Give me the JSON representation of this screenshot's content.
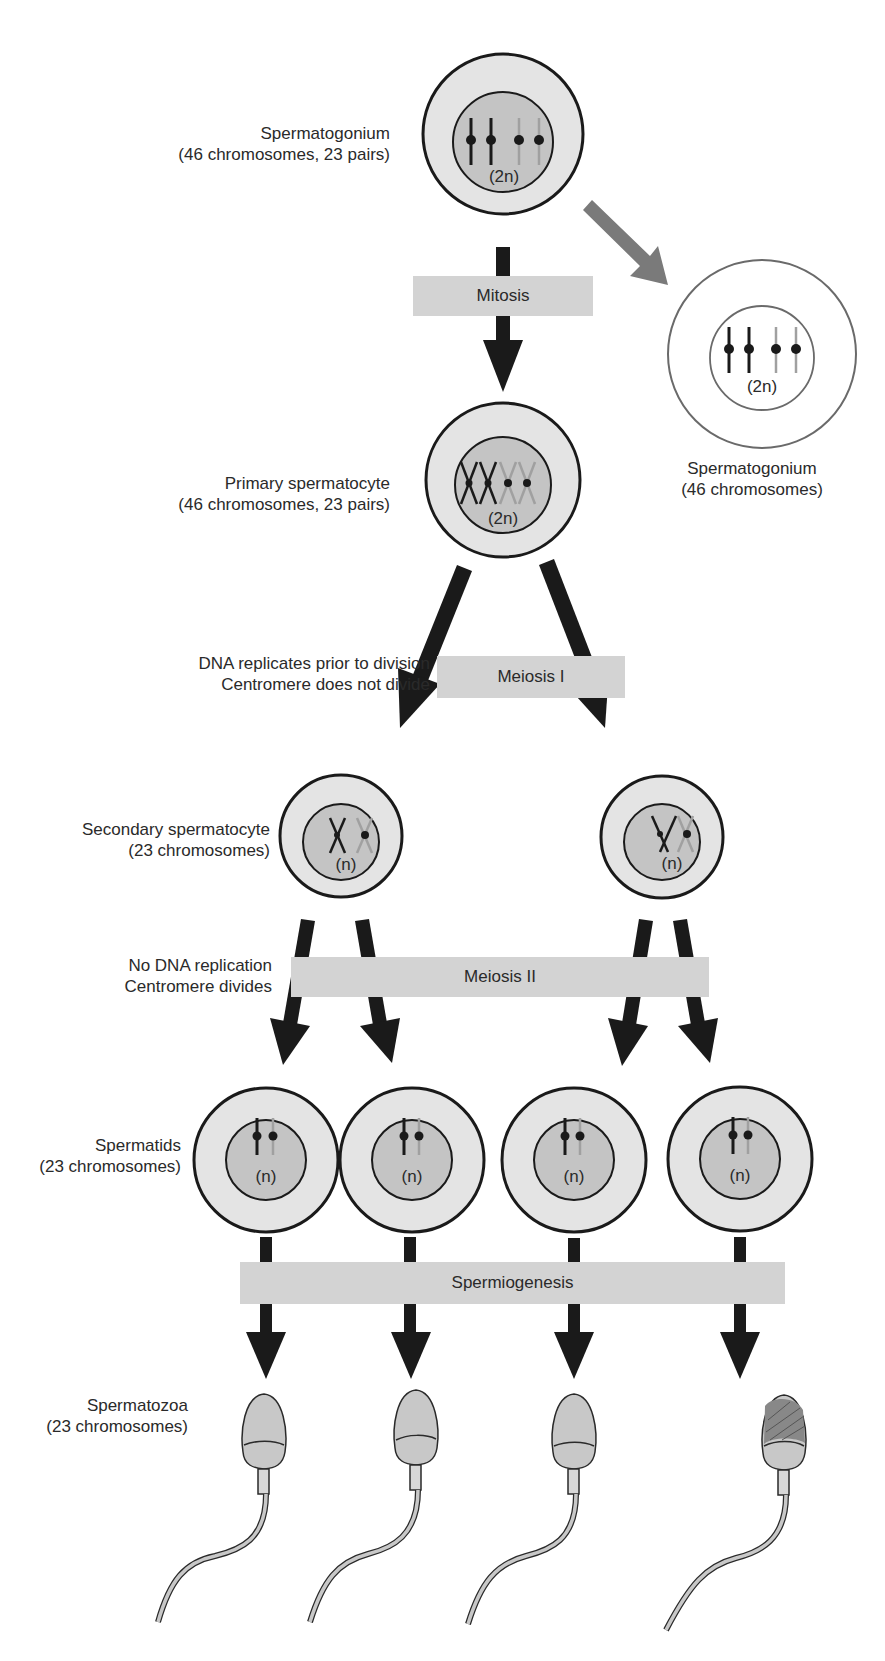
{
  "diagram": {
    "title_fragment": "Spermatogenesis",
    "stages": {
      "spermatogonium": {
        "name": "Spermatogonium",
        "detail": "(46 chromosomes, 23 pairs)",
        "ploidy": "(2n)"
      },
      "spermatogonium_side": {
        "name": "Spermatogonium",
        "detail": "(46 chromosomes)",
        "ploidy": "(2n)"
      },
      "primary": {
        "name": "Primary spermatocyte",
        "detail": "(46 chromosomes, 23 pairs)",
        "ploidy": "(2n)"
      },
      "secondary": {
        "name": "Secondary spermatocyte",
        "detail": "(23 chromosomes)",
        "ploidy": "(n)"
      },
      "spermatids": {
        "name": "Spermatids",
        "detail": "(23 chromosomes)",
        "ploidy": "(n)"
      },
      "spermatozoa": {
        "name": "Spermatozoa",
        "detail": "(23 chromosomes)"
      }
    },
    "processes": {
      "mitosis": "Mitosis",
      "meiosis1": "Meiosis I",
      "meiosis2": "Meiosis II",
      "spermiogenesis": "Spermiogenesis"
    },
    "notes": {
      "meiosis1_line1": "DNA replicates prior to division",
      "meiosis1_line2": "Centromere does not divide",
      "meiosis2_line1": "No DNA replication",
      "meiosis2_line2": "Centromere divides"
    },
    "colors": {
      "cell_outer": "#e4e4e4",
      "cell_inner": "#c4c4c4",
      "outline": "#1a1a1a",
      "band": "#d3d3d3",
      "arrow": "#1a1a1a",
      "side_arrow": "#7a7a7a",
      "light_chromosome": "#a0a0a0"
    }
  }
}
